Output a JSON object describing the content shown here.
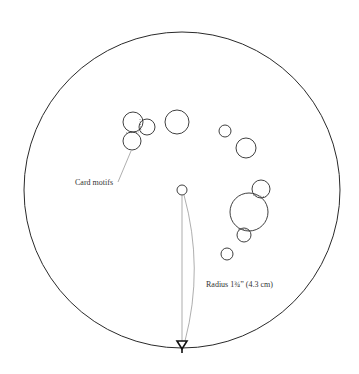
{
  "diagram": {
    "labels": {
      "card_motifs": "Card motifs",
      "radius": "Radius 1¾” (4.3 cm)"
    },
    "colors": {
      "stroke": "#2a2a2a",
      "thin_stroke": "#777777",
      "background": "#ffffff"
    },
    "outer_circle": {
      "cx": 182,
      "cy": 190,
      "r": 158
    },
    "center_point": {
      "cx": 182,
      "cy": 190,
      "r": 5
    },
    "motif_circles": [
      {
        "cx": 133,
        "cy": 122,
        "r": 10
      },
      {
        "cx": 147,
        "cy": 127,
        "r": 8
      },
      {
        "cx": 132,
        "cy": 141,
        "r": 9
      },
      {
        "cx": 177,
        "cy": 122,
        "r": 12
      },
      {
        "cx": 225,
        "cy": 131,
        "r": 6
      },
      {
        "cx": 246,
        "cy": 148,
        "r": 10
      },
      {
        "cx": 249,
        "cy": 212,
        "r": 19
      },
      {
        "cx": 261,
        "cy": 189,
        "r": 9
      },
      {
        "cx": 244,
        "cy": 235,
        "r": 7
      },
      {
        "cx": 227,
        "cy": 254,
        "r": 6
      }
    ]
  }
}
